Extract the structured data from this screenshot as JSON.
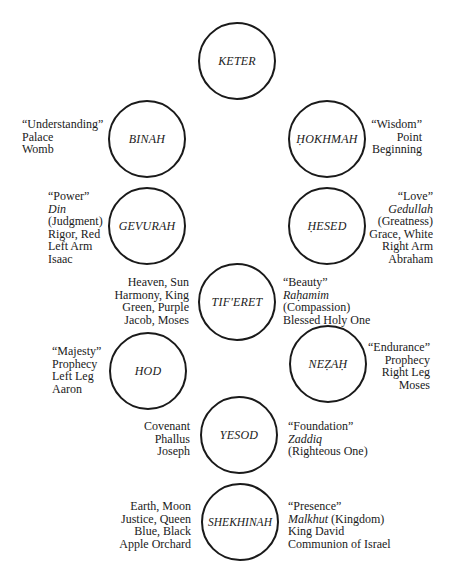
{
  "diagram": {
    "type": "sefirot-tree",
    "nodes": [
      {
        "id": "keter",
        "label": "KETER"
      },
      {
        "id": "binah",
        "label": "BINAH"
      },
      {
        "id": "hokhmah",
        "label": "ḤOKHMAH"
      },
      {
        "id": "gevurah",
        "label": "GEVURAH"
      },
      {
        "id": "hesed",
        "label": "ḤESED"
      },
      {
        "id": "tiferet",
        "label": "TIF'ERET"
      },
      {
        "id": "hod",
        "label": "HOD"
      },
      {
        "id": "nezah",
        "label": "NEẒAḤ"
      },
      {
        "id": "yesod",
        "label": "YESOD"
      },
      {
        "id": "shekhinah",
        "label": "SHEKHINAH"
      }
    ],
    "attributes": {
      "binah": [
        "“Understanding”",
        "Palace",
        "Womb"
      ],
      "hokhmah": [
        "“Wisdom”",
        "Point",
        "Beginning"
      ],
      "gevurah": [
        "“Power”",
        "Din",
        "(Judgment)",
        "Rigor, Red",
        "Left Arm",
        "Isaac"
      ],
      "hesed": [
        "“Love”",
        "Gedullah",
        "(Greatness)",
        "Grace, White",
        "Right Arm",
        "Abraham"
      ],
      "tiferet_left": [
        "Heaven, Sun",
        "Harmony, King",
        "Green, Purple",
        "Jacob, Moses"
      ],
      "tiferet_right": [
        "“Beauty”",
        "Raḥamim",
        "(Compassion)",
        "Blessed Holy One"
      ],
      "hod": [
        "“Majesty”",
        "Prophecy",
        "Left Leg",
        "Aaron"
      ],
      "nezah": [
        "“Endurance”",
        "Prophecy",
        "Right Leg",
        "Moses"
      ],
      "yesod_left": [
        "Covenant",
        "Phallus",
        "Joseph"
      ],
      "yesod_right": [
        "“Foundation”",
        "Zaddiq",
        "(Righteous One)"
      ],
      "shekhinah_left": [
        "Earth, Moon",
        "Justice, Queen",
        "Blue, Black",
        "Apple Orchard"
      ],
      "shekhinah_right": [
        "“Presence”",
        "Malkhut",
        " (Kingdom)",
        "King David",
        "Communion of Israel"
      ]
    }
  }
}
